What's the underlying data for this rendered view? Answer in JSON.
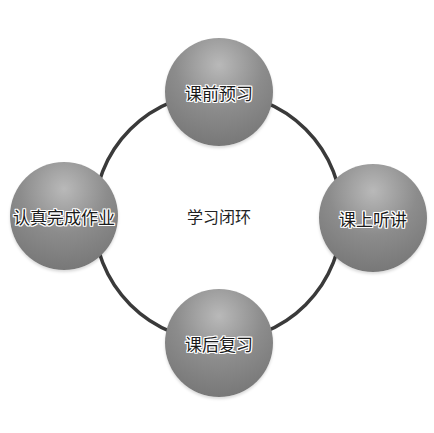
{
  "diagram": {
    "type": "cycle",
    "center": {
      "label": "学习闭环"
    },
    "nodes": [
      {
        "id": "top",
        "label": "课前预习"
      },
      {
        "id": "right",
        "label": "课上听讲"
      },
      {
        "id": "bottom",
        "label": "课后复习"
      },
      {
        "id": "left",
        "label": "认真完成作业"
      }
    ],
    "colors": {
      "ring": "#3a3a3a",
      "node_fill": "#8c8c8c",
      "text": "#1a1a1a",
      "background": "#ffffff"
    }
  }
}
